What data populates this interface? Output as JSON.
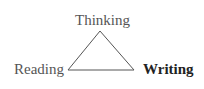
{
  "diagram": {
    "type": "triangle",
    "nodes": [
      {
        "id": "thinking",
        "label": "Thinking",
        "position": "top",
        "emphasis": false
      },
      {
        "id": "reading",
        "label": "Reading",
        "position": "bottom-left",
        "emphasis": false
      },
      {
        "id": "writing",
        "label": "Writing",
        "position": "bottom-right",
        "emphasis": true
      }
    ],
    "edges": [
      {
        "from": "thinking",
        "to": "reading"
      },
      {
        "from": "reading",
        "to": "writing"
      },
      {
        "from": "writing",
        "to": "thinking"
      }
    ],
    "colors": {
      "background": "#ffffff",
      "line": "#555555",
      "text": "#555555",
      "emphasis_text": "#222222"
    }
  }
}
